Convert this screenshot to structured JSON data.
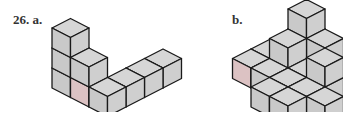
{
  "problem": {
    "number_label": "26. a.",
    "part_b_label": "b."
  },
  "style": {
    "face_top": "#d6d6d6",
    "face_left": "#c9c9c9",
    "face_right": "#cfcfcf",
    "highlight": "#dcc2c3",
    "stroke": "#1a1a1a"
  },
  "figures": [
    {
      "id": "a",
      "origin": [
        52,
        88
      ],
      "cubes": [
        [
          0,
          0,
          0
        ],
        [
          0,
          0,
          1
        ],
        [
          0,
          0,
          2
        ],
        [
          1,
          0,
          0
        ],
        [
          1,
          0,
          1
        ],
        [
          2,
          0,
          0
        ],
        [
          2,
          1,
          0
        ],
        [
          2,
          2,
          0
        ],
        [
          2,
          3,
          0
        ]
      ],
      "highlight_cube": [
        1,
        0,
        0
      ],
      "highlight_face": "left"
    },
    {
      "id": "b",
      "origin": [
        214,
        88
      ],
      "cubes": [
        [
          0,
          1,
          0
        ],
        [
          0,
          2,
          0
        ],
        [
          1,
          2,
          0
        ],
        [
          2,
          2,
          0
        ],
        [
          1,
          2,
          1
        ],
        [
          1,
          1,
          0
        ],
        [
          2,
          1,
          0
        ],
        [
          2,
          0,
          0
        ],
        [
          3,
          0,
          0
        ],
        [
          3,
          1,
          0
        ],
        [
          1,
          3,
          0
        ],
        [
          1,
          3,
          1
        ],
        [
          1,
          3,
          2
        ],
        [
          2,
          3,
          0
        ],
        [
          2,
          3,
          1
        ],
        [
          3,
          2,
          0
        ],
        [
          3,
          2,
          1
        ],
        [
          4,
          1,
          0
        ]
      ],
      "highlight_cube": [
        0,
        1,
        0
      ],
      "highlight_face": "left"
    }
  ]
}
